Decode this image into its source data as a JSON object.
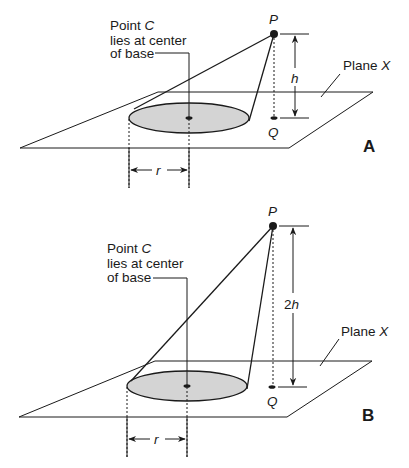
{
  "diagrams": [
    {
      "id": "A",
      "panel_label": "A",
      "apex_label": "P",
      "foot_label": "Q",
      "height_label": "h",
      "radius_label": "r",
      "plane_label_prefix": "Plane ",
      "plane_label_var": "X",
      "center_note": {
        "line1_prefix": "Point ",
        "line1_var": "C",
        "line2": "lies at center",
        "line3": "of base"
      }
    },
    {
      "id": "B",
      "panel_label": "B",
      "apex_label": "P",
      "foot_label": "Q",
      "height_label_num": "2",
      "height_label_var": "h",
      "radius_label": "r",
      "plane_label_prefix": "Plane ",
      "plane_label_var": "X",
      "center_note": {
        "line1_prefix": "Point ",
        "line1_var": "C",
        "line2": "lies at center",
        "line3": "of base"
      }
    }
  ],
  "colors": {
    "stroke": "#1a1a1a",
    "base_fill": "#d4d4d4",
    "background": "#ffffff"
  }
}
